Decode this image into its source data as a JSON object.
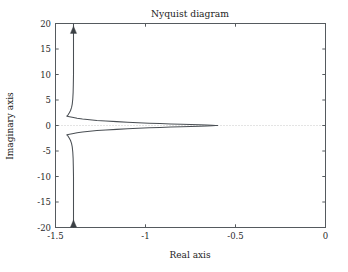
{
  "chart_data": {
    "type": "line",
    "title": "Nyquist diagram",
    "xlabel": "Real axis",
    "ylabel": "Imaginary axis",
    "xlim": [
      -1.5,
      0
    ],
    "ylim": [
      -20,
      20
    ],
    "grid": false,
    "legend": null,
    "x_ticks": [
      -1.5,
      -1,
      -0.5,
      0
    ],
    "x_tick_labels": [
      "-1.5",
      "-1",
      "-0.5",
      "0"
    ],
    "y_ticks": [
      -20,
      -15,
      -10,
      -5,
      0,
      5,
      10,
      15,
      20
    ],
    "y_tick_labels": [
      "-20",
      "-15",
      "-10",
      "-5",
      "0",
      "5",
      "10",
      "15",
      "20"
    ],
    "reference_lines": [
      {
        "name": "imaginary-zero-line",
        "orientation": "horizontal",
        "value": 0,
        "style": "dotted",
        "color": "#c9c9c9"
      }
    ],
    "annotations": [
      {
        "name": "direction-arrow-upper",
        "x": -1.4,
        "y": 18.5,
        "marker": "triangle-up"
      },
      {
        "name": "direction-arrow-lower",
        "x": -1.4,
        "y": -19.5,
        "marker": "triangle-up"
      }
    ],
    "series": [
      {
        "name": "Nyquist contour (upper branch)",
        "color": "#4a4f54",
        "points": [
          [
            -1.4,
            20.0
          ],
          [
            -1.4,
            18.5
          ],
          [
            -1.4,
            16.0
          ],
          [
            -1.4,
            13.0
          ],
          [
            -1.4,
            10.0
          ],
          [
            -1.401,
            8.0
          ],
          [
            -1.402,
            6.5
          ],
          [
            -1.404,
            5.2
          ],
          [
            -1.407,
            4.2
          ],
          [
            -1.411,
            3.5
          ],
          [
            -1.417,
            2.9
          ],
          [
            -1.424,
            2.45
          ],
          [
            -1.43,
            2.1
          ],
          [
            -1.437,
            1.82
          ],
          [
            -1.4,
            1.55
          ],
          [
            -1.38,
            1.42
          ],
          [
            -1.35,
            1.28
          ],
          [
            -1.31,
            1.13
          ],
          [
            -1.27,
            1.0
          ],
          [
            -1.22,
            0.88
          ],
          [
            -1.16,
            0.76
          ],
          [
            -1.1,
            0.65
          ],
          [
            -1.04,
            0.55
          ],
          [
            -0.98,
            0.46
          ],
          [
            -0.92,
            0.38
          ],
          [
            -0.86,
            0.31
          ],
          [
            -0.8,
            0.24
          ],
          [
            -0.75,
            0.19
          ],
          [
            -0.7,
            0.14
          ],
          [
            -0.66,
            0.09
          ],
          [
            -0.63,
            0.05
          ],
          [
            -0.61,
            0.02
          ],
          [
            -0.6,
            0.0
          ]
        ]
      },
      {
        "name": "Nyquist contour (lower branch)",
        "color": "#4a4f54",
        "points": [
          [
            -1.4,
            -20.0
          ],
          [
            -1.4,
            -18.5
          ],
          [
            -1.4,
            -16.0
          ],
          [
            -1.4,
            -13.0
          ],
          [
            -1.4,
            -10.0
          ],
          [
            -1.401,
            -8.0
          ],
          [
            -1.402,
            -6.5
          ],
          [
            -1.404,
            -5.2
          ],
          [
            -1.407,
            -4.2
          ],
          [
            -1.411,
            -3.5
          ],
          [
            -1.417,
            -2.9
          ],
          [
            -1.424,
            -2.45
          ],
          [
            -1.43,
            -2.1
          ],
          [
            -1.437,
            -1.82
          ],
          [
            -1.4,
            -1.55
          ],
          [
            -1.38,
            -1.42
          ],
          [
            -1.35,
            -1.28
          ],
          [
            -1.31,
            -1.13
          ],
          [
            -1.27,
            -1.0
          ],
          [
            -1.22,
            -0.88
          ],
          [
            -1.16,
            -0.76
          ],
          [
            -1.1,
            -0.65
          ],
          [
            -1.04,
            -0.55
          ],
          [
            -0.98,
            -0.46
          ],
          [
            -0.92,
            -0.38
          ],
          [
            -0.86,
            -0.31
          ],
          [
            -0.8,
            -0.24
          ],
          [
            -0.75,
            -0.19
          ],
          [
            -0.7,
            -0.14
          ],
          [
            -0.66,
            -0.09
          ],
          [
            -0.63,
            -0.05
          ],
          [
            -0.61,
            -0.02
          ],
          [
            -0.6,
            0.0
          ]
        ]
      }
    ]
  }
}
